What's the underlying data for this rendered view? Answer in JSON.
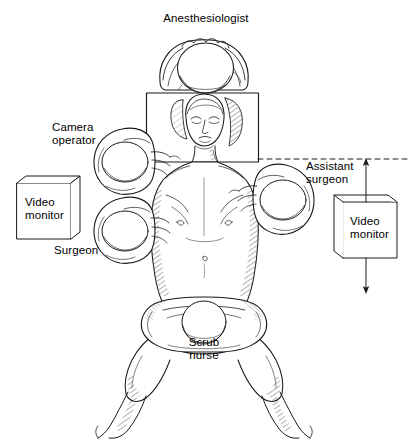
{
  "figure": {
    "type": "medical-illustration",
    "width": 408,
    "height": 439,
    "background_color": "#ffffff",
    "line_color": "#1a1a1a",
    "shading_color": "#9a9a9a"
  },
  "labels": {
    "anesthesiologist": "Anesthesiologist",
    "camera_operator_line1": "Camera",
    "camera_operator_line2": "operator",
    "assistant_surgeon_line1": "Assistant",
    "assistant_surgeon_line2": "surgeon",
    "surgeon": "Surgeon",
    "scrub_nurse_line1": "Scrub",
    "scrub_nurse_line2": "nurse",
    "video_monitor_left_line1": "Video",
    "video_monitor_left_line2": "monitor",
    "video_monitor_right_line1": "Video",
    "video_monitor_right_line2": "monitor"
  },
  "elements": {
    "operating_table": "operating-table",
    "patient": "patient-supine",
    "dashed_sightline": "dashed-sight-line",
    "arrow_to_monitor": "arrow-down-to-monitor",
    "arrow_up_to_sightline": "arrow-up-to-sight-line"
  }
}
